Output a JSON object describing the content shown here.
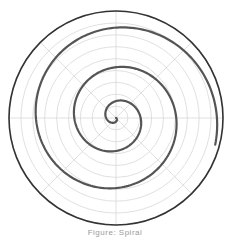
{
  "chart_data": {
    "type": "line",
    "subtype": "polar",
    "title": "",
    "caption": "Figure: Spiral",
    "series": [
      {
        "name": "spiral",
        "description": "Archimedean-like spiral growing outward counterclockwise from center, ending near angle ~-15 degrees at radius ~0.96",
        "theta_turns": 3.0,
        "r_start": 0.0,
        "r_end": 0.96,
        "color": "#555555"
      }
    ],
    "grid": true,
    "rings": 9,
    "radial_lines_deg": [
      0,
      45,
      90,
      135,
      180,
      225,
      270,
      315
    ],
    "rlim": [
      0,
      1
    ]
  },
  "colors": {
    "spiral": "#555555",
    "outer_circle": "#333333",
    "grid": "#d8d8d8",
    "caption": "#9a9a9a"
  },
  "caption": "Figure: Spiral"
}
